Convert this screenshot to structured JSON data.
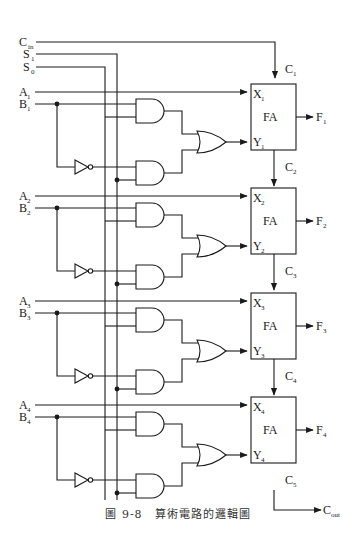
{
  "diagram": {
    "type": "logic-circuit",
    "global_inputs": [
      {
        "name": "C",
        "sub": "in"
      },
      {
        "name": "S",
        "sub": "1"
      },
      {
        "name": "S",
        "sub": "0"
      }
    ],
    "stages": [
      {
        "a": {
          "name": "A",
          "sub": "1"
        },
        "b": {
          "name": "B",
          "sub": "1"
        },
        "x": {
          "name": "X",
          "sub": "1"
        },
        "y": {
          "name": "Y",
          "sub": "1"
        },
        "f": {
          "name": "F",
          "sub": "1"
        },
        "cin": {
          "name": "C",
          "sub": "1"
        },
        "cout": {
          "name": "C",
          "sub": "2"
        },
        "block": "FA"
      },
      {
        "a": {
          "name": "A",
          "sub": "2"
        },
        "b": {
          "name": "B",
          "sub": "2"
        },
        "x": {
          "name": "X",
          "sub": "2"
        },
        "y": {
          "name": "Y",
          "sub": "2"
        },
        "f": {
          "name": "F",
          "sub": "2"
        },
        "cin": {
          "name": "C",
          "sub": "2"
        },
        "cout": {
          "name": "C",
          "sub": "3"
        },
        "block": "FA"
      },
      {
        "a": {
          "name": "A",
          "sub": "3"
        },
        "b": {
          "name": "B",
          "sub": "3"
        },
        "x": {
          "name": "X",
          "sub": "3"
        },
        "y": {
          "name": "Y",
          "sub": "3"
        },
        "f": {
          "name": "F",
          "sub": "3"
        },
        "cin": {
          "name": "C",
          "sub": "3"
        },
        "cout": {
          "name": "C",
          "sub": "4"
        },
        "block": "FA"
      },
      {
        "a": {
          "name": "A",
          "sub": "4"
        },
        "b": {
          "name": "B",
          "sub": "4"
        },
        "x": {
          "name": "X",
          "sub": "4"
        },
        "y": {
          "name": "Y",
          "sub": "4"
        },
        "f": {
          "name": "F",
          "sub": "4"
        },
        "cin": {
          "name": "C",
          "sub": "4"
        },
        "cout": {
          "name": "C",
          "sub": "5"
        },
        "block": "FA"
      }
    ],
    "final_output": {
      "name": "C",
      "sub": "out"
    },
    "caption": "圖 9-8　算術電路的邏輯圖"
  }
}
